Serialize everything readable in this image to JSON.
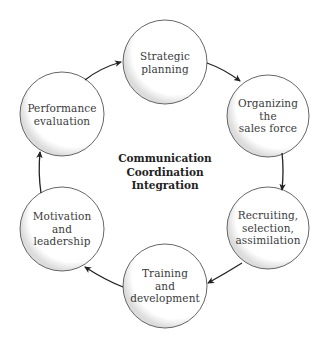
{
  "diagram": {
    "type": "cycle",
    "center": {
      "lines": [
        "Communication",
        "Coordination",
        "Integration"
      ]
    },
    "nodes": [
      {
        "id": "strategic-planning",
        "lines": [
          "Strategic",
          "planning"
        ],
        "cx": 165,
        "cy": 62,
        "r": 42
      },
      {
        "id": "organizing-sales-force",
        "lines": [
          "Organizing",
          "the",
          "sales force"
        ],
        "cx": 268,
        "cy": 116,
        "r": 41
      },
      {
        "id": "recruiting-selection-assimilation",
        "lines": [
          "Recruiting,",
          "selection,",
          "assimilation"
        ],
        "cx": 268,
        "cy": 228,
        "r": 41
      },
      {
        "id": "training-development",
        "lines": [
          "Training",
          "and",
          "development"
        ],
        "cx": 165,
        "cy": 286,
        "r": 42
      },
      {
        "id": "motivation-leadership",
        "lines": [
          "Motivation",
          "and",
          "leadership"
        ],
        "cx": 62,
        "cy": 229,
        "r": 42
      },
      {
        "id": "performance-evaluation",
        "lines": [
          "Performance",
          "evaluation"
        ],
        "cx": 62,
        "cy": 114,
        "r": 42
      }
    ],
    "edges": [
      {
        "from": "performance-evaluation",
        "to": "strategic-planning"
      },
      {
        "from": "strategic-planning",
        "to": "organizing-sales-force"
      },
      {
        "from": "organizing-sales-force",
        "to": "recruiting-selection-assimilation"
      },
      {
        "from": "recruiting-selection-assimilation",
        "to": "training-development"
      },
      {
        "from": "training-development",
        "to": "motivation-leadership"
      },
      {
        "from": "motivation-leadership",
        "to": "performance-evaluation"
      }
    ],
    "colors": {
      "stroke": "#555555",
      "arrow": "#222222",
      "text": "#3a3a3a",
      "shadow": "#d8d8d8",
      "background": "#ffffff"
    }
  }
}
